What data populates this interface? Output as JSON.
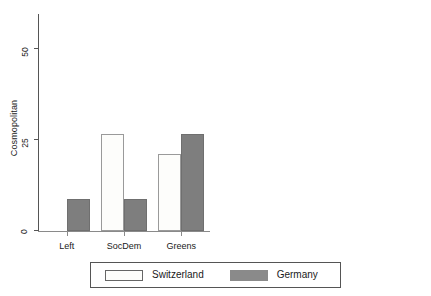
{
  "chart_data": {
    "type": "bar",
    "title": "",
    "layout": "two side-by-side grouped bar panels, shared legend below",
    "grid": false,
    "categories": [
      "Left",
      "SocDem",
      "Greens"
    ],
    "legend": {
      "position": "bottom-center",
      "entries": [
        {
          "name": "Switzerland",
          "color": "#fdfdfb",
          "swatch": "open-rectangle"
        },
        {
          "name": "Germany",
          "color": "#7e7e7e",
          "swatch": "filled-rectangle"
        }
      ]
    },
    "panels": [
      {
        "ylabel": "Cosmopolitan",
        "xlabel": "",
        "ylim": [
          0,
          60
        ],
        "yticks": [
          0,
          25,
          50
        ],
        "ytick_labels": [
          "0",
          "25",
          "50"
        ],
        "series": [
          {
            "name": "Switzerland",
            "values": [
              0,
              26.8,
              21.3
            ]
          },
          {
            "name": "Germany",
            "values": [
              8.7,
              8.7,
              26.6
            ]
          }
        ]
      },
      {
        "ylabel": "Migration background",
        "xlabel": "",
        "ylim": [
          0,
          60
        ],
        "yticks": [
          0,
          25,
          50
        ],
        "ytick_labels": [
          "0",
          "25",
          "50"
        ],
        "series": [
          {
            "name": "Switzerland",
            "values": [
              0,
              50.0,
              7.0
            ]
          },
          {
            "name": "Germany",
            "values": [
              16.0,
              14.5,
              18.0
            ]
          }
        ]
      }
    ]
  },
  "panel_left": {
    "ylabel": "Cosmopolitan",
    "ytick_0": "0",
    "ytick_25": "25",
    "ytick_50": "50",
    "xlabel_1": "Left",
    "xlabel_2": "SocDem",
    "xlabel_3": "Greens"
  },
  "panel_right": {
    "ylabel": "Migration background",
    "ytick_0": "0",
    "ytick_25": "25",
    "ytick_50": "50",
    "xlabel_1": "Left",
    "xlabel_2": "SocDem",
    "xlabel_3": "Greens"
  },
  "legend": {
    "switzerland_label": "Switzerland",
    "germany_label": "Germany"
  }
}
